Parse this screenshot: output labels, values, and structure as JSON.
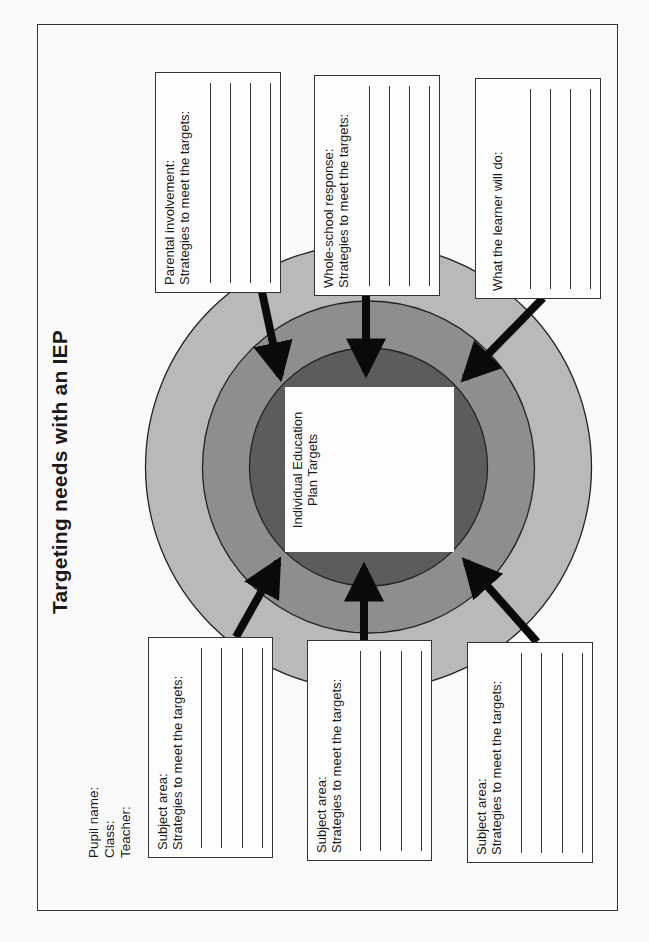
{
  "document": {
    "title": "Targeting needs with an IEP",
    "orientation": "landscape page rotated 90 degrees counter-clockwise"
  },
  "pupil_info": {
    "fields": [
      {
        "label": "Pupil name:"
      },
      {
        "label": "Class:"
      },
      {
        "label": "Teacher:"
      }
    ]
  },
  "center": {
    "line1": "Individual Education",
    "line2": "Plan Targets"
  },
  "rings": {
    "outer_color": "#b9b9b9",
    "middle_color": "#8e8e8e",
    "inner_color": "#5c5c5c",
    "center_box_color": "#ffffff"
  },
  "boxes": [
    {
      "id": "parental",
      "heading": "Parental involvement:",
      "subheading": "Strategies to meet the targets:",
      "lines": 4
    },
    {
      "id": "whole-school",
      "heading": "Whole-school response:",
      "subheading": "Strategies to meet the targets:",
      "lines": 4
    },
    {
      "id": "learner",
      "heading": "What the learner will do:",
      "subheading": "",
      "lines": 4
    },
    {
      "id": "subject-1",
      "heading": "Subject area:",
      "subheading": "Strategies to meet the targets:",
      "lines": 4
    },
    {
      "id": "subject-2",
      "heading": "Subject area:",
      "subheading": "Strategies to meet the targets:",
      "lines": 4
    },
    {
      "id": "subject-3",
      "heading": "Subject area:",
      "subheading": "Strategies to meet the targets:",
      "lines": 4
    }
  ]
}
